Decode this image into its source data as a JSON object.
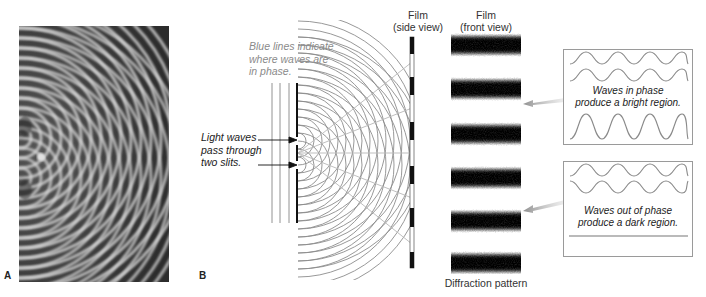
{
  "panel_a": {
    "label": "A",
    "image_description": "photograph of ripple-tank two-source wave interference"
  },
  "panel_b": {
    "label": "B",
    "annotation_blue_lines": [
      "Blue lines indicate",
      "where waves are",
      "in phase."
    ],
    "annotation_slits": [
      "Light waves",
      "pass through",
      "two slits."
    ],
    "film_side_heading": [
      "Film",
      "(side view)"
    ],
    "film_front_heading": [
      "Film",
      "(front view)"
    ],
    "diffraction_caption": "Diffraction pattern",
    "bright_box": {
      "caption": [
        "Waves in phase",
        "produce a bright region."
      ]
    },
    "dark_box": {
      "caption": [
        "Waves out of phase",
        "produce a dark region."
      ]
    },
    "front_view_band_count": 6,
    "colors": {
      "wave_lines": "#8c8c8c",
      "in_phase_lines": "#b8b8b8",
      "film": "#111111",
      "arrow": "#9a9a9a",
      "box_border": "#9a9a9a"
    }
  }
}
